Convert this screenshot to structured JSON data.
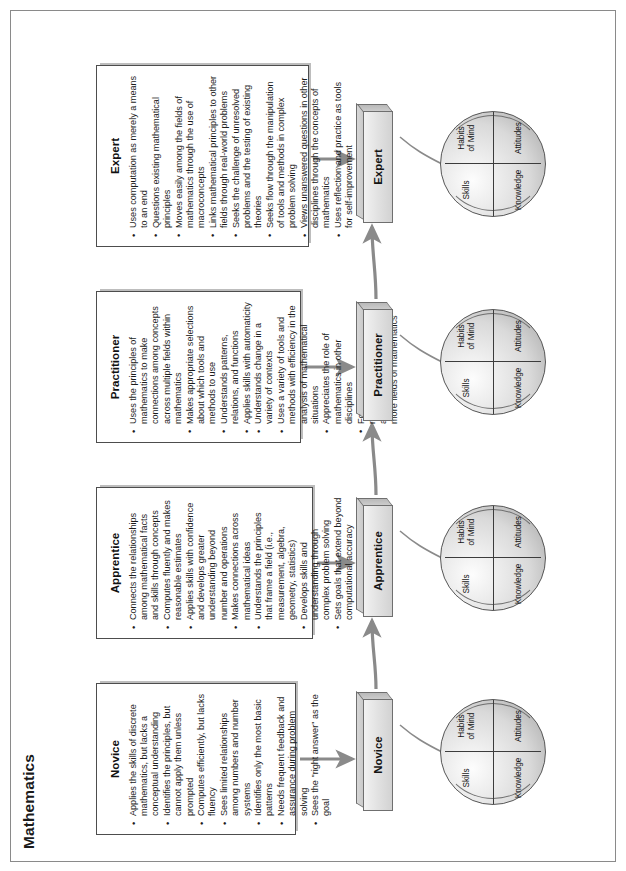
{
  "page": {
    "title": "Mathematics"
  },
  "stages": [
    {
      "id": "novice",
      "label": "Novice",
      "bullets": [
        "Applies the skills of discrete mathematics, but lacks a conceptual understanding",
        "Identifies the principles, but cannot apply them unless prompted",
        "Computes efficiently, but lacks fluency",
        "Sees limited relationships among numbers and number systems",
        "Identifies only the most basic patterns",
        "Needs frequent feedback and assurance during problem solving",
        "Sees the \"right answer\" as the goal"
      ]
    },
    {
      "id": "apprentice",
      "label": "Apprentice",
      "bullets": [
        "Connects the relationships among mathematical facts and skills through concepts",
        "Computes fluently and makes reasonable estimates",
        "Applies skills with confidence and develops greater understanding beyond number and operations",
        "Makes connections across mathematical ideas",
        "Understands the principles that frame a field (i.e., measurement, algebra, geometry, statistics)",
        "Develops skills and understanding through complex problem solving",
        "Sets goals that extend beyond computational accuracy"
      ]
    },
    {
      "id": "practitioner",
      "label": "Practitioner",
      "bullets": [
        "Uses the principles of mathematics to make connections among concepts across multiple fields within mathematics",
        "Makes appropriate selections about which tools and methods to use",
        "Understands patterns, relations, and functions",
        "Applies skills with automaticity",
        "Understands change in a variety of contexts",
        "Uses a variety of tools and methods with efficiency in the analysis of mathematical situations",
        "Appreciates the role of mathematics in other disciplines",
        "Formulates questions for research that can be addressed through one or more fields of mathematics"
      ]
    },
    {
      "id": "expert",
      "label": "Expert",
      "bullets": [
        "Uses computation as merely a means to an end",
        "Questions existing mathematical principles",
        "Moves easily among the fields of mathematics through the use of macroconcepts",
        "Links mathematical principles to other fields through real-world problems",
        "Seeks the challenge of unresolved problems and the testing of existing theories",
        "Seeks flow through the manipulation of tools and methods in complex problem solving",
        "Views unanswered questions in other disciplines through the concepts of mathematics",
        "Uses reflection and practice as tools for self-improvement"
      ]
    }
  ],
  "sphere": {
    "quadrants": {
      "top_left": "Skills",
      "top_right": "Habits\nof Mind",
      "bottom_left": "Knowledge",
      "bottom_right": "Attitudes"
    },
    "knowledge": "Knowledge",
    "skills": "Skills",
    "attitudes": "Attitudes",
    "habits_of_mind": "Habits of Mind"
  },
  "colors": {
    "page_border": "#8a8a8a",
    "box_border": "#4d4d4d",
    "box_shadow": "#bdbdbd",
    "stage_fill": "#e3e3e3",
    "stage_border": "#6f6f6f",
    "sphere_fill": "#d9d9d9",
    "arrow": "#7d7d7d",
    "text": "#1c1c1c"
  }
}
